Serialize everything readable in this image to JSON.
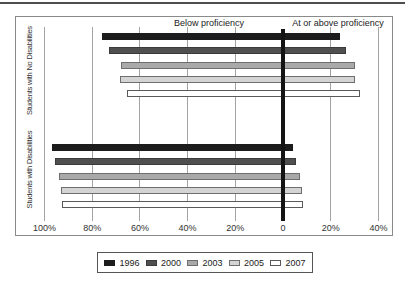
{
  "page": {
    "top_rule_color": "#4e4e4e"
  },
  "chart_data": {
    "type": "bar",
    "orientation": "horizontal-diverging",
    "left_header": "Below proficiency",
    "right_header": "At or above proficiency",
    "axis": {
      "tick_labels": [
        "100%",
        "80%",
        "60%",
        "40%",
        "20%",
        "0",
        "20%",
        "40%"
      ],
      "tick_values": [
        -100,
        -80,
        -60,
        -40,
        -20,
        0,
        20,
        40
      ],
      "grid": true,
      "zero_line": "thick-black"
    },
    "groups": [
      {
        "label": "Students with No Disabilities",
        "bars": [
          {
            "year": "1996",
            "below": 76,
            "above": 24
          },
          {
            "year": "2000",
            "below": 73,
            "above": 26.5
          },
          {
            "year": "2003",
            "below": 68,
            "above": 30
          },
          {
            "year": "2005",
            "below": 68.2,
            "above": 30.4
          },
          {
            "year": "2007",
            "below": 65.6,
            "above": 32.4
          }
        ]
      },
      {
        "label": "Students with Disabilities",
        "bars": [
          {
            "year": "1996",
            "below": 97,
            "above": 4
          },
          {
            "year": "2000",
            "below": 95.5,
            "above": 5.5
          },
          {
            "year": "2003",
            "below": 94,
            "above": 7
          },
          {
            "year": "2005",
            "below": 93,
            "above": 7.8
          },
          {
            "year": "2007",
            "below": 92.5,
            "above": 8.3
          }
        ]
      }
    ],
    "legend": [
      {
        "label": "1996",
        "fill": "#1c1c1c",
        "border": "#1c1c1c"
      },
      {
        "label": "2000",
        "fill": "#4f4f4f",
        "border": "#3a3a3a"
      },
      {
        "label": "2003",
        "fill": "#a9a9a9",
        "border": "#6e6e6e"
      },
      {
        "label": "2005",
        "fill": "#d4d4d4",
        "border": "#6e6e6e"
      },
      {
        "label": "2007",
        "fill": "#ffffff",
        "border": "#5a5a5a"
      }
    ],
    "legend_position": "bottom"
  }
}
